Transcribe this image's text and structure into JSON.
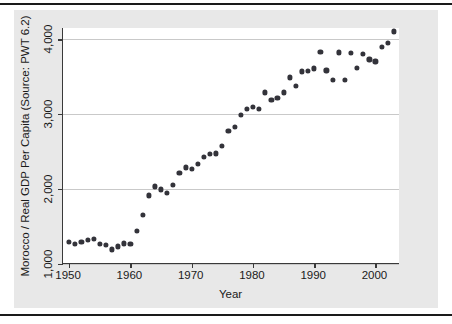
{
  "chart_data": {
    "type": "scatter",
    "title": "",
    "xlabel": "Year",
    "ylabel": "Morocco / Real GDP Per Capita (Source: PWT 6.2)",
    "xlim": [
      1949,
      2004
    ],
    "ylim": [
      1000,
      4150
    ],
    "xticks": [
      1950,
      1960,
      1970,
      1980,
      1990,
      2000
    ],
    "xticklabels": [
      "1950",
      "1960",
      "1970",
      "1980",
      "1990",
      "2000"
    ],
    "yticks": [
      1000,
      2000,
      3000,
      4000
    ],
    "yticklabels": [
      "1,000",
      "2,000",
      "3,000",
      "4,000"
    ],
    "grid": "horizontal",
    "legend": "none",
    "marker": "filled-circle",
    "marker_color": "#33333a",
    "x": [
      1950,
      1951,
      1952,
      1953,
      1954,
      1955,
      1956,
      1957,
      1958,
      1959,
      1960,
      1961,
      1962,
      1963,
      1964,
      1965,
      1966,
      1967,
      1968,
      1969,
      1970,
      1971,
      1972,
      1973,
      1974,
      1975,
      1976,
      1977,
      1978,
      1979,
      1980,
      1981,
      1982,
      1983,
      1984,
      1985,
      1986,
      1987,
      1988,
      1989,
      1990,
      1991,
      1992,
      1993,
      1994,
      1995,
      1996,
      1997,
      1998,
      1999,
      2000,
      2001,
      2002,
      2003
    ],
    "y": [
      1300,
      1270,
      1290,
      1320,
      1330,
      1270,
      1260,
      1195,
      1235,
      1275,
      1270,
      1445,
      1660,
      1915,
      2035,
      1995,
      1945,
      2055,
      2220,
      2290,
      2265,
      2340,
      2430,
      2465,
      2475,
      2580,
      2775,
      2835,
      2985,
      3075,
      3100,
      3065,
      3290,
      3185,
      3220,
      3290,
      3490,
      3375,
      3570,
      3575,
      3610,
      3830,
      3585,
      3460,
      3825,
      3455,
      3820,
      3620,
      3800,
      3730,
      3705,
      3895,
      3955,
      4105
    ]
  },
  "axis": {
    "y_label": "Morocco / Real GDP Per Capita (Source: PWT 6.2)",
    "x_label": "Year"
  }
}
